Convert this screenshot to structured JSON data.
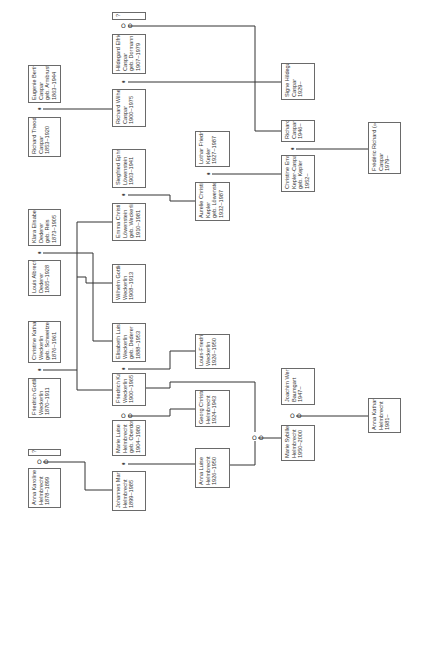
{
  "people": [
    {
      "id": "unknown-top",
      "x": 112,
      "y": 12,
      "w": 34,
      "h": 8,
      "text": "?"
    },
    {
      "id": "hildegard",
      "x": 112,
      "y": 34,
      "w": 34,
      "h": 40,
      "text": "Hildegard Elfriede\nCaspar\ngeb. Dormann\n1907–1979"
    },
    {
      "id": "eugenie",
      "x": 28,
      "y": 65,
      "w": 33,
      "h": 38,
      "text": "Eugenie Bertha\nCaspar\ngeb. Armbruster\n1863–1944"
    },
    {
      "id": "richard-wilhelm",
      "x": 112,
      "y": 89,
      "w": 34,
      "h": 38,
      "text": "Richard Wilhelm\nCaspar\n1900–1975"
    },
    {
      "id": "richard-theodor",
      "x": 28,
      "y": 117,
      "w": 33,
      "h": 40,
      "text": "Richard Theodor\nCaspar\n1853–1920"
    },
    {
      "id": "signe",
      "x": 281,
      "y": 63,
      "w": 34,
      "h": 37,
      "text": "Signe Hildegard\nCaspar\n1929–"
    },
    {
      "id": "richard-caspar",
      "x": 281,
      "y": 120,
      "w": 34,
      "h": 22,
      "text": "Richard\nCaspar\n1946–"
    },
    {
      "id": "frederic",
      "x": 368,
      "y": 122,
      "w": 33,
      "h": 52,
      "text": "Frédéric Richard (»Fritz«)\nCaspar\n1979–"
    },
    {
      "id": "lothar",
      "x": 195,
      "y": 131,
      "w": 35,
      "h": 36,
      "text": "Lothar Friedrich\nKepler\n1927–1987"
    },
    {
      "id": "christine-emma",
      "x": 281,
      "y": 155,
      "w": 34,
      "h": 37,
      "text": "Christine Emma\nKepler-Caspar\ngeb. Kepler\n1952–"
    },
    {
      "id": "siegfried",
      "x": 112,
      "y": 149,
      "w": 34,
      "h": 39,
      "text": "Siegfried Ephraim\nLöwenstein\n1903–1941"
    },
    {
      "id": "aurelie",
      "x": 195,
      "y": 182,
      "w": 35,
      "h": 39,
      "text": "Aurelie Christine\nKepler\ngeb. Löwenstein\n1932–1987"
    },
    {
      "id": "emma-christine",
      "x": 112,
      "y": 203,
      "w": 34,
      "h": 38,
      "text": "Emma Christine\nLöwenstein\ngeb. Weckerlin\n1910–1981"
    },
    {
      "id": "klara",
      "x": 28,
      "y": 209,
      "w": 33,
      "h": 37,
      "text": "Klara Elisabeth\nDederer\ngeb. Reis\n1873–1905"
    },
    {
      "id": "louis-albrecht",
      "x": 28,
      "y": 260,
      "w": 33,
      "h": 36,
      "text": "Louis Albrecht\nDederer\n1865–1928"
    },
    {
      "id": "wilhelm",
      "x": 112,
      "y": 264,
      "w": 34,
      "h": 39,
      "text": "Wilhelm Gottlieb\nWeckerlin\n1908–1913"
    },
    {
      "id": "christine-katharina",
      "x": 28,
      "y": 321,
      "w": 33,
      "h": 42,
      "text": "Christine Katharina\nWeckerlin\ngeb. Schweitzer\n1876–1961"
    },
    {
      "id": "elisabeth-luise",
      "x": 112,
      "y": 323,
      "w": 34,
      "h": 39,
      "text": "Elisabeth Luise\nWeckerlin\ngeb. Dederer\n1888–1953"
    },
    {
      "id": "louis-friedrich",
      "x": 195,
      "y": 334,
      "w": 35,
      "h": 35,
      "text": "Louis-Friedrich\nWeckerlin\n1926–1950"
    },
    {
      "id": "friedrich-gottlieb",
      "x": 28,
      "y": 378,
      "w": 33,
      "h": 40,
      "text": "Friedrich Gottlieb\nWeckerlin\n1870–1911"
    },
    {
      "id": "friedrich-karl",
      "x": 112,
      "y": 373,
      "w": 34,
      "h": 33,
      "text": "Friedrich Karl\nWeckerlin\n1900–1965"
    },
    {
      "id": "joachim",
      "x": 281,
      "y": 368,
      "w": 34,
      "h": 37,
      "text": "Joachim Werner\nBaumgart\n1947–"
    },
    {
      "id": "georg",
      "x": 195,
      "y": 390,
      "w": 35,
      "h": 37,
      "text": "Georg Christoph\nHelmbrecht\n1924–1943"
    },
    {
      "id": "marie-luise",
      "x": 112,
      "y": 420,
      "w": 34,
      "h": 36,
      "text": "Marie Luise\nHelmbrecht\ngeb. Oberdorfer\n1904–1980"
    },
    {
      "id": "anna-katharina",
      "x": 368,
      "y": 398,
      "w": 33,
      "h": 35,
      "text": "Anna Katharina\nHelmbrecht\n1981–"
    },
    {
      "id": "maria-sybille",
      "x": 281,
      "y": 425,
      "w": 34,
      "h": 36,
      "text": "Marie Sybille\nHelmbrecht\n1950–2000"
    },
    {
      "id": "anna-luise",
      "x": 195,
      "y": 448,
      "w": 35,
      "h": 40,
      "text": "Anna Luise\nHelmbrecht\n1926–1950"
    },
    {
      "id": "unknown-bottom",
      "x": 28,
      "y": 449,
      "w": 33,
      "h": 7,
      "text": "?"
    },
    {
      "id": "anna-karoline",
      "x": 28,
      "y": 468,
      "w": 33,
      "h": 40,
      "text": "Anna Karoline\nHelmbrecht\n1878–1899"
    },
    {
      "id": "johannes",
      "x": 112,
      "y": 471,
      "w": 34,
      "h": 40,
      "text": "Johannes Martin\nHelmbrecht\n1899–1985"
    }
  ],
  "markers": [
    {
      "id": "m-hildegard-unknown",
      "x": 121,
      "y": 23,
      "type": "partnership",
      "glyph": "O O"
    },
    {
      "id": "m-caspar-parents",
      "x": 37,
      "y": 106,
      "type": "marriage",
      "glyph": "⚭"
    },
    {
      "id": "m-richard-hildegard",
      "x": 121,
      "y": 79,
      "type": "marriage",
      "glyph": "⚭"
    },
    {
      "id": "m-christine-richard",
      "x": 290,
      "y": 146,
      "type": "marriage",
      "glyph": "⚭"
    },
    {
      "id": "m-lothar-aurelie",
      "x": 206,
      "y": 171,
      "type": "marriage",
      "glyph": "⚭"
    },
    {
      "id": "m-siegfried-emma",
      "x": 121,
      "y": 192,
      "type": "marriage",
      "glyph": "⚭"
    },
    {
      "id": "m-dederer",
      "x": 37,
      "y": 250,
      "type": "marriage",
      "glyph": "⚭"
    },
    {
      "id": "m-weckerlin-parents",
      "x": 37,
      "y": 367,
      "type": "marriage",
      "glyph": "⚭"
    },
    {
      "id": "m-karl-elisabeth",
      "x": 121,
      "y": 366,
      "type": "marriage",
      "glyph": "⚭"
    },
    {
      "id": "m-karl-marie",
      "x": 121,
      "y": 413,
      "type": "partnership",
      "glyph": "O O"
    },
    {
      "id": "m-sybille-joachim",
      "x": 290,
      "y": 413,
      "type": "partnership",
      "glyph": "O O"
    },
    {
      "id": "m-anna-luise-karl",
      "x": 252,
      "y": 435,
      "type": "partnership",
      "glyph": "O O"
    },
    {
      "id": "m-marie-johannes",
      "x": 121,
      "y": 461,
      "type": "marriage",
      "glyph": "⚭"
    },
    {
      "id": "m-karoline-unknown",
      "x": 37,
      "y": 459,
      "type": "partnership",
      "glyph": "O O"
    }
  ],
  "connectors": [
    {
      "id": "c-hild-unknown-richard",
      "points": "128,26 255,26 255,131 281,131"
    },
    {
      "id": "c-rw-hild-signe",
      "points": "128,82 281,82"
    },
    {
      "id": "c-caspar-parents-rw",
      "points": "43,109 112,109"
    },
    {
      "id": "c-christine-richard-frederic",
      "points": "296,149 368,149"
    },
    {
      "id": "c-lothar-aurelie-christine",
      "points": "212,174 281,174"
    },
    {
      "id": "c-siegfried-emma-aurelie",
      "points": "128,195 170,195 170,201 195,201"
    },
    {
      "id": "c-dederer-elisabeth",
      "points": "43,253 93,253 93,341 112,341"
    },
    {
      "id": "c-weckerlin-spine",
      "points": "43,370 77,370"
    },
    {
      "id": "c-spine-vertical",
      "points": "77,222 77,390"
    },
    {
      "id": "c-spine-emma",
      "points": "77,222 112,222"
    },
    {
      "id": "c-spine-wilhelm",
      "points": "77,277 86,277 86,283 112,283"
    },
    {
      "id": "c-spine-karl",
      "points": "77,390 112,390"
    },
    {
      "id": "c-karl-elisabeth-louis",
      "points": "128,369 170,369 170,351 195,351"
    },
    {
      "id": "c-karl-anna-luise",
      "points": "146,388 170,388 170,382 255,382 255,432"
    },
    {
      "id": "c-karl-marie-georg",
      "points": "128,416 170,416 170,409 195,409"
    },
    {
      "id": "c-karoline-johannes",
      "points": "43,462 85,462 85,490 112,490"
    },
    {
      "id": "c-marie-johannes-anna-luise",
      "points": "128,464 195,464"
    },
    {
      "id": "c-anna-luise-to-marker",
      "points": "230,465 255,465 255,441"
    },
    {
      "id": "c-marker-to-sybille",
      "points": "258,438 281,438"
    },
    {
      "id": "c-sybille-joachim-anna",
      "points": "296,416 368,416"
    }
  ],
  "colors": {
    "line": "#333333",
    "box_border": "#6a6a6a",
    "text": "#333333",
    "background": "#ffffff"
  }
}
